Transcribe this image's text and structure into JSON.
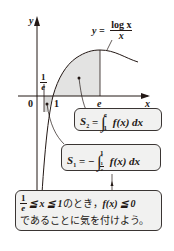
{
  "graph": {
    "y_axis_label": "y",
    "x_axis_label": "x",
    "origin_label": "0",
    "tick_one": "1",
    "tick_e": "e",
    "tick_recip_e": {
      "num": "1",
      "den": "e"
    },
    "curve_label": {
      "lhs": "y =",
      "num": "log x",
      "den": "x"
    },
    "colors": {
      "curve": "#231815",
      "shade": "#e3e3e2",
      "axis": "#231815"
    }
  },
  "boxes": {
    "s2": {
      "lhs": "S",
      "sub": "2",
      "eq": "=",
      "upper": "e",
      "lower": "1",
      "integrand": "f(x)",
      "dx": "dx"
    },
    "s1": {
      "lhs": "S",
      "sub": "1",
      "eq": "= −",
      "upper": "1",
      "lower_num": "1",
      "lower_den": "e",
      "integrand": "f(x)",
      "dx": "dx"
    },
    "note": {
      "frac_num": "1",
      "frac_den": "e",
      "line1_math": "≦ x ≦ 1",
      "line1_jp": "のとき，",
      "line1_cond": "f(x) ≦ 0",
      "line2": "であることに気を付けよう。"
    }
  }
}
